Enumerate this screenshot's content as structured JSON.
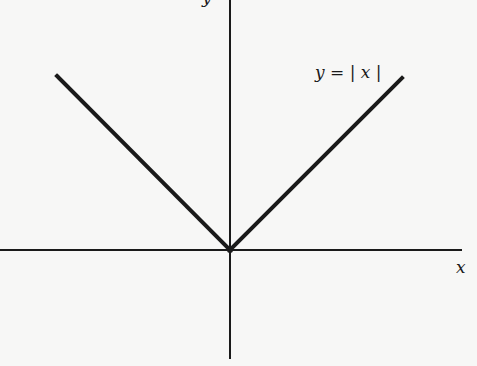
{
  "figure": {
    "curve_label": "y = | x |",
    "x_axis_label": "x",
    "y_axis_label": "y",
    "colors": {
      "background": "#f7f7f6",
      "ink": "#1a1a1a"
    }
  },
  "geometry": {
    "origin": [
      230,
      250
    ],
    "x_axis": {
      "x1": 0,
      "y1": 250,
      "x2": 462,
      "y2": 250
    },
    "y_axis": {
      "x1": 230,
      "y1": 0,
      "x2": 230,
      "y2": 359
    },
    "left_arm": {
      "x1": 57,
      "y1": 76,
      "x2": 230,
      "y2": 250
    },
    "right_arm": {
      "x1": 230,
      "y1": 250,
      "x2": 402,
      "y2": 78
    }
  }
}
